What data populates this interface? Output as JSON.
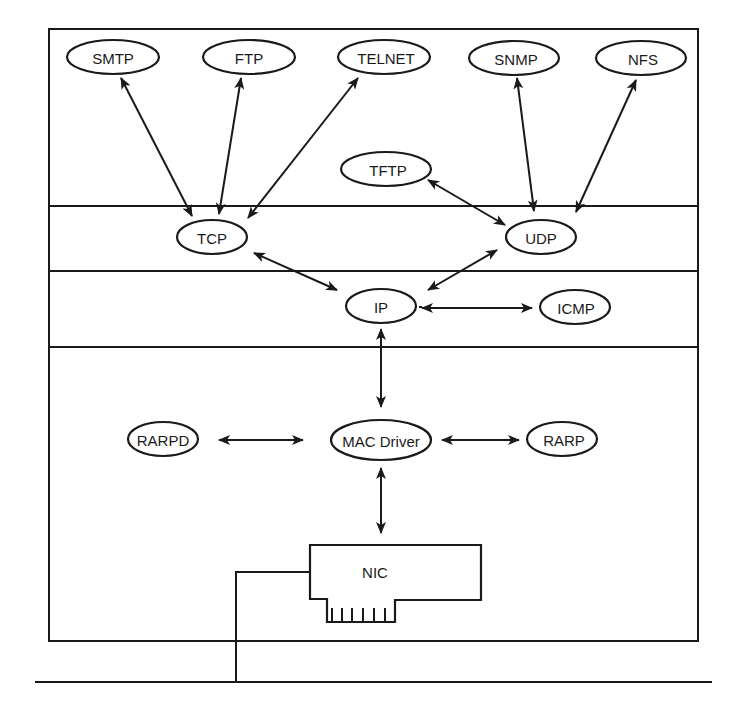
{
  "diagram": {
    "type": "protocol-stack",
    "layers": [
      "application",
      "transport",
      "network",
      "link"
    ],
    "nodes": {
      "smtp": {
        "label": "SMTP",
        "x": 113,
        "y": 57,
        "rx": 46,
        "ry": 17
      },
      "ftp": {
        "label": "FTP",
        "x": 246,
        "y": 57,
        "rx": 46,
        "ry": 17
      },
      "telnet": {
        "label": "TELNET",
        "x": 384,
        "y": 57,
        "rx": 46,
        "ry": 17
      },
      "snmp": {
        "label": "SNMP",
        "x": 514,
        "y": 58,
        "rx": 45,
        "ry": 17
      },
      "nfs": {
        "label": "NFS",
        "x": 641,
        "y": 58,
        "rx": 45,
        "ry": 17
      },
      "tftp": {
        "label": "TFTP",
        "x": 385,
        "y": 169,
        "rx": 45,
        "ry": 17
      },
      "tcp": {
        "label": "TCP",
        "x": 212,
        "y": 237,
        "rx": 35,
        "ry": 17
      },
      "udp": {
        "label": "UDP",
        "x": 541,
        "y": 237,
        "rx": 35,
        "ry": 17
      },
      "ip": {
        "label": "IP",
        "x": 381,
        "y": 305,
        "rx": 35,
        "ry": 17
      },
      "icmp": {
        "label": "ICMP",
        "x": 575,
        "y": 306,
        "rx": 35,
        "ry": 17
      },
      "rarpd": {
        "label": "RARPD",
        "x": 163,
        "y": 439,
        "rx": 35,
        "ry": 17
      },
      "mac_driver": {
        "label": "MAC Driver",
        "x": 381,
        "y": 439,
        "rx": 50,
        "ry": 21
      },
      "rarp": {
        "label": "RARP",
        "x": 562,
        "y": 439,
        "rx": 35,
        "ry": 17
      }
    },
    "nic": {
      "label": "NIC"
    },
    "edges": [
      [
        "smtp",
        "tcp"
      ],
      [
        "ftp",
        "tcp"
      ],
      [
        "telnet",
        "tcp"
      ],
      [
        "snmp",
        "udp"
      ],
      [
        "nfs",
        "udp"
      ],
      [
        "tftp",
        "udp"
      ],
      [
        "tcp",
        "ip"
      ],
      [
        "udp",
        "ip"
      ],
      [
        "ip",
        "icmp"
      ],
      [
        "ip",
        "mac_driver"
      ],
      [
        "rarpd",
        "mac_driver"
      ],
      [
        "mac_driver",
        "rarp"
      ],
      [
        "mac_driver",
        "nic"
      ]
    ]
  }
}
